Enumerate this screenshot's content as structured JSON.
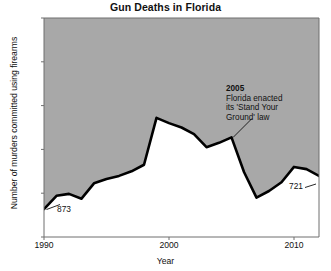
{
  "chart_data": {
    "type": "line",
    "title": "Gun Deaths in Florida",
    "xlabel": "Year",
    "ylabel": "Number of murders committed using firearms",
    "x": [
      1990,
      1991,
      1992,
      1993,
      1994,
      1995,
      1996,
      1997,
      1998,
      1999,
      2000,
      2001,
      2002,
      2003,
      2004,
      2005,
      2006,
      2007,
      2008,
      2009,
      2010,
      2011,
      2012
    ],
    "values": [
      873,
      812,
      803,
      825,
      755,
      735,
      721,
      700,
      670,
      456,
      480,
      500,
      530,
      590,
      570,
      545,
      703,
      820,
      790,
      750,
      680,
      690,
      721
    ],
    "series": [
      {
        "name": "Murders committed using firearms",
        "values": [
          873,
          812,
          803,
          825,
          755,
          735,
          721,
          700,
          670,
          456,
          480,
          500,
          530,
          590,
          570,
          545,
          703,
          820,
          790,
          750,
          680,
          690,
          721
        ]
      }
    ],
    "xlim": [
      1990,
      2012
    ],
    "ylim": [
      0,
      1000
    ],
    "y_axis_inverted": true,
    "grid": false,
    "legend": false,
    "fill": "above-line",
    "fill_color": "#a8a8a8",
    "line_color": "#000000",
    "plot_background": "#ffffff",
    "yticks": [
      {
        "value": 0,
        "label": "0"
      },
      {
        "value": 200,
        "label": "200"
      },
      {
        "value": 400,
        "label": "400"
      },
      {
        "value": 600,
        "label": "600"
      },
      {
        "value": 800,
        "label": "800"
      },
      {
        "value": 1000,
        "label": "1,000"
      }
    ],
    "xticks": [
      {
        "value": 1990,
        "label": "1990"
      },
      {
        "value": 2000,
        "label": "2000"
      },
      {
        "value": 2010,
        "label": "2010"
      }
    ],
    "annotations": [
      {
        "id": "stand-your-ground",
        "head": "2005",
        "body": "Florida enacted\nits 'Stand Your\nGround' law",
        "points_to_x": 2005,
        "points_to_y": 545
      },
      {
        "id": "start-value",
        "label": "873",
        "points_to_x": 1990,
        "points_to_y": 873
      },
      {
        "id": "end-value",
        "label": "721",
        "points_to_x": 2012,
        "points_to_y": 721
      }
    ]
  }
}
